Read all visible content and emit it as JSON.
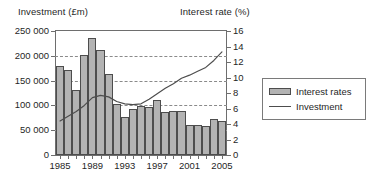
{
  "chart_data": {
    "type": "bar",
    "title": "",
    "xlabel": "",
    "ylabel": "Investment (£m)",
    "y2label": "Interest rate (%)",
    "grid": true,
    "legend_position": "right",
    "x": [
      1985,
      1986,
      1987,
      1988,
      1989,
      1990,
      1991,
      1992,
      1993,
      1994,
      1995,
      1996,
      1997,
      1998,
      1999,
      2000,
      2001,
      2002,
      2003,
      2004,
      2005
    ],
    "categories": [
      "1985",
      "1986",
      "1987",
      "1988",
      "1989",
      "1990",
      "1991",
      "1992",
      "1993",
      "1994",
      "1995",
      "1996",
      "1997",
      "1998",
      "1999",
      "2000",
      "2001",
      "2002",
      "2003",
      "2004",
      "2005"
    ],
    "ylim": [
      0,
      250000
    ],
    "yticks": [
      0,
      50000,
      100000,
      150000,
      200000,
      250000
    ],
    "ytick_labels": [
      "0",
      "50 000",
      "100 000",
      "150 000",
      "200 000",
      "250 000"
    ],
    "y2lim": [
      0,
      16
    ],
    "y2ticks": [
      0,
      2,
      4,
      6,
      8,
      10,
      12,
      14,
      16
    ],
    "y2tick_labels": [
      "0",
      "2",
      "4",
      "6",
      "8",
      "10",
      "12",
      "14",
      "16"
    ],
    "xtick_labels": [
      "1985",
      "1989",
      "1993",
      "1997",
      "2001",
      "2005"
    ],
    "xtick_values": [
      1985,
      1989,
      1993,
      1997,
      2001,
      2005
    ],
    "series": [
      {
        "name": "Interest rates",
        "render": "bar",
        "axis": "left",
        "color": "#b3b3b3",
        "edge_color": "#4d4d4d",
        "values": [
          180000,
          171000,
          131000,
          202000,
          235000,
          211000,
          163000,
          102000,
          77000,
          93000,
          98000,
          96000,
          110000,
          87000,
          88000,
          88000,
          60000,
          61000,
          59000,
          73000,
          68000
        ]
      },
      {
        "name": "Investment",
        "render": "line",
        "axis": "right",
        "color": "#4d4d4d",
        "values": [
          4.4,
          5.0,
          5.6,
          6.4,
          7.4,
          7.7,
          7.5,
          6.9,
          6.6,
          6.5,
          6.6,
          7.2,
          7.9,
          8.6,
          9.2,
          9.9,
          10.3,
          10.8,
          11.3,
          12.2,
          13.3
        ]
      }
    ],
    "legend": [
      {
        "label": "Interest rates",
        "marker": "bar"
      },
      {
        "label": "Investment",
        "marker": "line"
      }
    ]
  }
}
